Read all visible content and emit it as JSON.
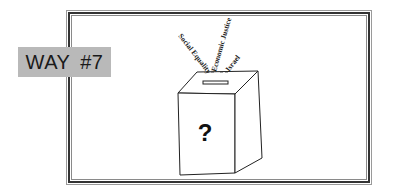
{
  "label": {
    "text": "WAY #7"
  },
  "ballot_box": {
    "symbol": "?",
    "issues": [
      "Social Equality",
      "Economic Justice",
      "Israel"
    ]
  },
  "colors": {
    "label_bg": "#b9b9b9",
    "frame": "#333333"
  }
}
